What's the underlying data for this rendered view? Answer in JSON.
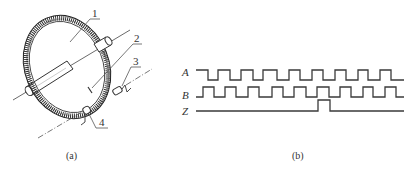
{
  "figure": {
    "left_panel": {
      "caption": "(a)",
      "labels": [
        {
          "id": "1",
          "text": "1",
          "x": 95,
          "y": 17
        },
        {
          "id": "2",
          "text": "2",
          "x": 137,
          "y": 42
        },
        {
          "id": "3",
          "text": "3",
          "x": 136,
          "y": 65
        },
        {
          "id": "4",
          "text": "4",
          "x": 102,
          "y": 126
        }
      ],
      "components": [
        "code-disc",
        "shaft",
        "photo-sensor-slot",
        "light-source-3",
        "light-source-4"
      ]
    },
    "right_panel": {
      "caption": "(b)",
      "signals": [
        {
          "name": "A",
          "high_y": 70,
          "low_y": 80,
          "start_level": "high",
          "x_start": 196,
          "x_end": 404,
          "edges": [
            208,
            218,
            230,
            241,
            253,
            263,
            277,
            289,
            300,
            312,
            323,
            335,
            346,
            358,
            368,
            380,
            391
          ]
        },
        {
          "name": "B",
          "high_y": 87,
          "low_y": 97,
          "start_level": "low",
          "x_start": 196,
          "x_end": 404,
          "edges": [
            203,
            214,
            225,
            236,
            248,
            259,
            272,
            283,
            294,
            306,
            317,
            329,
            340,
            351,
            363,
            373,
            385,
            396
          ]
        },
        {
          "name": "Z",
          "high_y": 100,
          "low_y": 111,
          "start_level": "low",
          "x_start": 196,
          "x_end": 404,
          "edges": [
            318,
            330
          ]
        }
      ]
    },
    "colors": {
      "ink": "#333333",
      "background": "#ffffff"
    }
  }
}
